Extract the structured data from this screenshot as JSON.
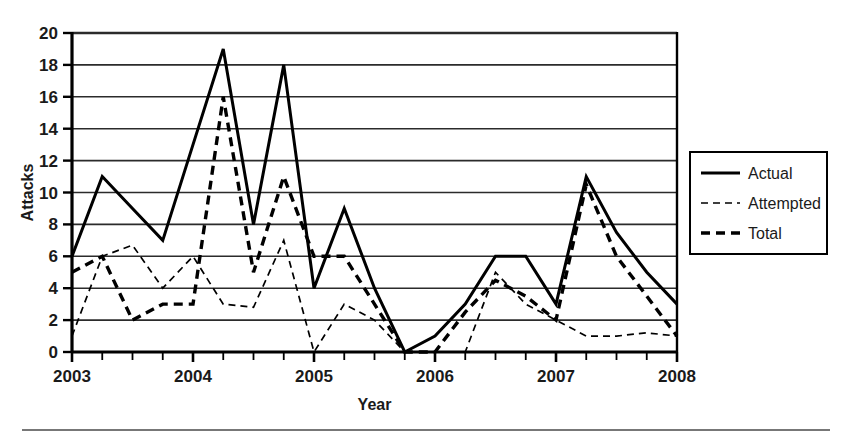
{
  "chart_data": {
    "type": "line",
    "title": "",
    "xlabel": "Year",
    "ylabel": "Attacks",
    "xlim": [
      2003.0,
      2008.0
    ],
    "ylim": [
      0,
      20
    ],
    "ytick_step": 2,
    "yticks": [
      0,
      2,
      4,
      6,
      8,
      10,
      12,
      14,
      16,
      18,
      20
    ],
    "xticks": [
      2003,
      2004,
      2005,
      2006,
      2007,
      2008
    ],
    "xtick_labels": [
      "2003",
      "2004",
      "2005",
      "2006",
      "2007",
      "2008"
    ],
    "minor_xticks_per_year": 4,
    "grid": "horizontal",
    "legend_position": "right-outside",
    "x": [
      2003.0,
      2003.25,
      2003.5,
      2003.75,
      2004.0,
      2004.25,
      2004.5,
      2004.75,
      2005.0,
      2005.25,
      2005.5,
      2005.75,
      2006.0,
      2006.25,
      2006.5,
      2006.75,
      2007.0,
      2007.25,
      2007.5,
      2007.75,
      2008.0
    ],
    "series": [
      {
        "name": "Actual",
        "style": "solid",
        "color": "#000000",
        "values": [
          6,
          11,
          9,
          7,
          13,
          19,
          8,
          18,
          4,
          9,
          4,
          0,
          1,
          3,
          6,
          6,
          3,
          11,
          7.5,
          5,
          3
        ]
      },
      {
        "name": "Attempted",
        "style": "dashed-fine",
        "color": "#000000",
        "values": [
          1,
          6,
          6.7,
          4,
          6,
          3,
          2.8,
          7,
          0,
          3,
          2,
          0,
          0,
          0,
          5,
          3,
          2,
          1,
          1,
          1.2,
          1
        ]
      },
      {
        "name": "Total",
        "style": "dashed-bold",
        "color": "#000000",
        "values": [
          5,
          6,
          2,
          3,
          3,
          16,
          5,
          11,
          6,
          6,
          3,
          0,
          0,
          2.5,
          4.5,
          3.5,
          2,
          10.5,
          6,
          3.5,
          1
        ]
      }
    ]
  },
  "axes": {
    "y_title": "Attacks",
    "x_title": "Year",
    "y_tick_labels": [
      "20",
      "18",
      "16",
      "14",
      "12",
      "10",
      "8",
      "6",
      "4",
      "2",
      "0"
    ],
    "x_tick_labels": [
      "2003",
      "2004",
      "2005",
      "2006",
      "2007",
      "2008"
    ]
  },
  "legend": {
    "entries": [
      {
        "label": "Actual",
        "style": "solid"
      },
      {
        "label": "Attempted",
        "style": "dashed-fine"
      },
      {
        "label": "Total",
        "style": "dashed-bold"
      }
    ]
  },
  "colors": {
    "ink": "#000000",
    "grid": "#2b2b2b",
    "background": "#ffffff",
    "rule": "#4a4a4a"
  }
}
